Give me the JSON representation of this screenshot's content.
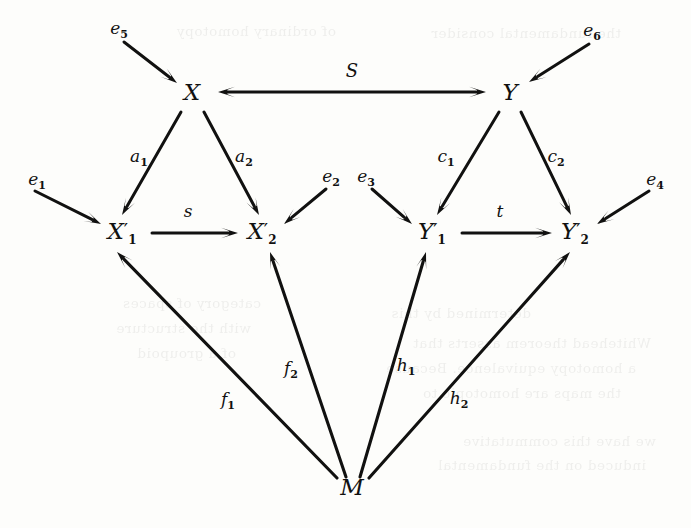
{
  "figure": {
    "type": "commutative-diagram",
    "width": 691,
    "height": 528,
    "background_color": "#fdfdfb",
    "ink_color": "#111110"
  },
  "nodes": [
    {
      "id": "X",
      "label": "X",
      "prime": "",
      "sub": "",
      "x": 192,
      "y": 92
    },
    {
      "id": "Y",
      "label": "Υ",
      "prime": "",
      "sub": "",
      "x": 510,
      "y": 92
    },
    {
      "id": "X1p",
      "label": "X",
      "prime": "′",
      "sub": "1",
      "x": 122,
      "y": 232
    },
    {
      "id": "X2p",
      "label": "X",
      "prime": "′",
      "sub": "2",
      "x": 262,
      "y": 232
    },
    {
      "id": "Y1p",
      "label": "Υ",
      "prime": "′",
      "sub": "1",
      "x": 432,
      "y": 232
    },
    {
      "id": "Y2p",
      "label": "Υ",
      "prime": "′",
      "sub": "2",
      "x": 575,
      "y": 232
    },
    {
      "id": "M",
      "label": "M",
      "prime": "",
      "sub": "",
      "x": 352,
      "y": 487
    }
  ],
  "edge_labels": [
    {
      "id": "S",
      "label": "S",
      "sub": "",
      "x": 352,
      "y": 70,
      "script": true
    },
    {
      "id": "a1",
      "label": "a",
      "sub": "1",
      "x": 139,
      "y": 157
    },
    {
      "id": "a2",
      "label": "a",
      "sub": "2",
      "x": 244,
      "y": 157
    },
    {
      "id": "c1",
      "label": "c",
      "sub": "1",
      "x": 446,
      "y": 157
    },
    {
      "id": "c2",
      "label": "c",
      "sub": "2",
      "x": 556,
      "y": 157
    },
    {
      "id": "s",
      "label": "s",
      "sub": "",
      "x": 188,
      "y": 211
    },
    {
      "id": "t",
      "label": "t",
      "sub": "",
      "x": 500,
      "y": 211
    },
    {
      "id": "f1",
      "label": "f",
      "sub": "1",
      "x": 228,
      "y": 400
    },
    {
      "id": "f2",
      "label": "f",
      "sub": "2",
      "x": 291,
      "y": 369
    },
    {
      "id": "h1",
      "label": "h",
      "sub": "1",
      "x": 406,
      "y": 366
    },
    {
      "id": "h2",
      "label": "h",
      "sub": "2",
      "x": 459,
      "y": 399
    },
    {
      "id": "e1",
      "label": "e",
      "sub": "1",
      "x": 37,
      "y": 180
    },
    {
      "id": "e2",
      "label": "e",
      "sub": "2",
      "x": 331,
      "y": 177
    },
    {
      "id": "e3",
      "label": "e",
      "sub": "3",
      "x": 366,
      "y": 177
    },
    {
      "id": "e4",
      "label": "e",
      "sub": "4",
      "x": 655,
      "y": 180
    },
    {
      "id": "e5",
      "label": "e",
      "sub": "5",
      "x": 119,
      "y": 29
    },
    {
      "id": "e6",
      "label": "e",
      "sub": "6",
      "x": 592,
      "y": 31
    }
  ],
  "edges": [
    {
      "id": "S",
      "from": "X",
      "to": "Y",
      "label": "S",
      "double_headed": true,
      "x1": 218,
      "y1": 92,
      "x2": 486,
      "y2": 92
    },
    {
      "id": "a1",
      "from": "X",
      "to": "X1p",
      "label": "a1",
      "double_headed": false,
      "x1": 181,
      "y1": 112,
      "x2": 122,
      "y2": 215
    },
    {
      "id": "a2",
      "from": "X",
      "to": "X2p",
      "label": "a2",
      "double_headed": false,
      "x1": 204,
      "y1": 112,
      "x2": 259,
      "y2": 215
    },
    {
      "id": "c1",
      "from": "Y",
      "to": "Y1p",
      "label": "c1",
      "double_headed": false,
      "x1": 499,
      "y1": 112,
      "x2": 437,
      "y2": 215
    },
    {
      "id": "c2",
      "from": "Y",
      "to": "Y2p",
      "label": "c2",
      "double_headed": false,
      "x1": 521,
      "y1": 112,
      "x2": 571,
      "y2": 215
    },
    {
      "id": "s",
      "from": "X1p",
      "to": "X2p",
      "label": "s",
      "double_headed": false,
      "x1": 152,
      "y1": 233,
      "x2": 238,
      "y2": 233
    },
    {
      "id": "t",
      "from": "Y1p",
      "to": "Y2p",
      "label": "t",
      "double_headed": false,
      "x1": 462,
      "y1": 233,
      "x2": 552,
      "y2": 233
    },
    {
      "id": "f1",
      "from": "M",
      "to": "X1p",
      "label": "f1",
      "double_headed": false,
      "x1": 337,
      "y1": 478,
      "x2": 117,
      "y2": 252
    },
    {
      "id": "f2",
      "from": "M",
      "to": "X2p",
      "label": "f2",
      "double_headed": false,
      "x1": 346,
      "y1": 477,
      "x2": 270,
      "y2": 252
    },
    {
      "id": "h1",
      "from": "M",
      "to": "Y1p",
      "label": "h1",
      "double_headed": false,
      "x1": 360,
      "y1": 477,
      "x2": 426,
      "y2": 252
    },
    {
      "id": "h2",
      "from": "M",
      "to": "Y2p",
      "label": "h2",
      "double_headed": false,
      "x1": 369,
      "y1": 478,
      "x2": 570,
      "y2": 252
    },
    {
      "id": "e1",
      "from": "e1",
      "to": "X1p",
      "label": "e1",
      "double_headed": false,
      "x1": 35,
      "y1": 191,
      "x2": 101,
      "y2": 224
    },
    {
      "id": "e2",
      "from": "e2",
      "to": "X2p",
      "label": "e2",
      "double_headed": false,
      "x1": 326,
      "y1": 189,
      "x2": 284,
      "y2": 224
    },
    {
      "id": "e3",
      "from": "e3",
      "to": "Y1p",
      "label": "e3",
      "double_headed": false,
      "x1": 372,
      "y1": 189,
      "x2": 412,
      "y2": 224
    },
    {
      "id": "e4",
      "from": "e4",
      "to": "Y2p",
      "label": "e4",
      "double_headed": false,
      "x1": 649,
      "y1": 191,
      "x2": 597,
      "y2": 224
    },
    {
      "id": "e5",
      "from": "e5",
      "to": "X",
      "label": "e5",
      "double_headed": false,
      "x1": 124,
      "y1": 42,
      "x2": 177,
      "y2": 83
    },
    {
      "id": "e6",
      "from": "e6",
      "to": "Y",
      "label": "e6",
      "double_headed": false,
      "x1": 589,
      "y1": 44,
      "x2": 529,
      "y2": 82
    }
  ],
  "bleed_lines": [
    {
      "text": "the fundamental consider",
      "x": 70,
      "y": 20
    },
    {
      "text": "of ordinary homotopy",
      "x": 355,
      "y": 18
    },
    {
      "text": "determined by this",
      "x": 160,
      "y": 300
    },
    {
      "text": "Whitehead theorem asserts that",
      "x": 40,
      "y": 330
    },
    {
      "text": "a homotopy equivalence. Because",
      "x": 55,
      "y": 355
    },
    {
      "text": "the maps are homotopic to",
      "x": 70,
      "y": 380
    },
    {
      "text": "we have this commutative",
      "x": 35,
      "y": 428
    },
    {
      "text": "induced on the fundamental",
      "x": 45,
      "y": 452
    },
    {
      "text": "category of spaces",
      "x": 430,
      "y": 290
    },
    {
      "text": "with the structure",
      "x": 440,
      "y": 315
    },
    {
      "text": "of a groupoid",
      "x": 455,
      "y": 340
    }
  ]
}
